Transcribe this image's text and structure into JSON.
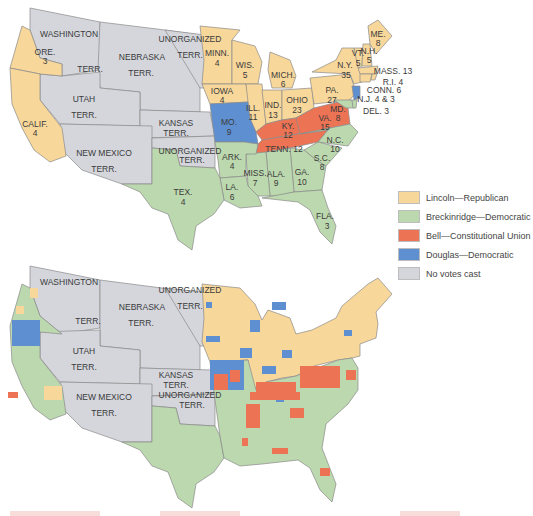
{
  "colors": {
    "lincoln": "#f8d79a",
    "breckinridge": "#bcd8ae",
    "bell": "#ec7455",
    "douglas": "#5e8fd0",
    "none": "#d4d6dc",
    "border": "#8a8a8a"
  },
  "legend": {
    "items": [
      {
        "label": "Lincoln—Republican",
        "color": "#f8d79a"
      },
      {
        "label": "Breckinridge—Democratic",
        "color": "#bcd8ae"
      },
      {
        "label": "Bell—Constitutional Union",
        "color": "#ec7455"
      },
      {
        "label": "Douglas—Democratic",
        "color": "#5e8fd0"
      },
      {
        "label": "No votes cast",
        "color": "#d4d6dc"
      }
    ]
  },
  "top_map": {
    "territories": {
      "washington": {
        "line1": "WASHINGTON",
        "line2": "TERR."
      },
      "nebraska": {
        "line1": "NEBRASKA",
        "line2": "TERR."
      },
      "unorganized_north": {
        "line1": "UNORGANIZED",
        "line2": "TERR."
      },
      "utah": {
        "line1": "UTAH",
        "line2": "TERR."
      },
      "kansas": {
        "line1": "KANSAS",
        "line2": "TERR."
      },
      "new_mexico": {
        "line1": "NEW MEXICO",
        "line2": "TERR."
      },
      "unorganized_south": {
        "line1": "UNORGANIZED",
        "line2": "TERR."
      }
    },
    "states": {
      "ore": {
        "name": "ORE.",
        "votes": "3"
      },
      "calif": {
        "name": "CALIF.",
        "votes": "4"
      },
      "minn": {
        "name": "MINN.",
        "votes": "4"
      },
      "wis": {
        "name": "WIS.",
        "votes": "5"
      },
      "iowa": {
        "name": "IOWA",
        "votes": "4"
      },
      "ill": {
        "name": "ILL.",
        "votes": "11"
      },
      "mich": {
        "name": "MICH.",
        "votes": "6"
      },
      "ind": {
        "name": "IND.",
        "votes": "13"
      },
      "ohio": {
        "name": "OHIO",
        "votes": "23"
      },
      "pa": {
        "name": "PA.",
        "votes": "27"
      },
      "ny": {
        "name": "N.Y.",
        "votes": "35"
      },
      "vt": {
        "name": "VT.",
        "votes": "5"
      },
      "nh": {
        "name": "N.H.",
        "votes": "5"
      },
      "me": {
        "name": "ME.",
        "votes": "8"
      },
      "mass": {
        "label": "MASS. 13"
      },
      "ri": {
        "label": "R.I. 4"
      },
      "conn": {
        "label": "CONN. 6"
      },
      "nj": {
        "label": "N.J. 4 & 3"
      },
      "del": {
        "label": "DEL. 3"
      },
      "md": {
        "name": "MD.",
        "votes": "8"
      },
      "mo": {
        "name": "MO.",
        "votes": "9"
      },
      "ky": {
        "name": "KY.",
        "votes": "12"
      },
      "va": {
        "name": "VA.",
        "votes": "15"
      },
      "tenn": {
        "label": "TENN. 12"
      },
      "nc": {
        "name": "N.C.",
        "votes": "10"
      },
      "sc": {
        "name": "S.C.",
        "votes": "8"
      },
      "ark": {
        "name": "ARK.",
        "votes": "4"
      },
      "miss": {
        "name": "MISS.",
        "votes": "7"
      },
      "ala": {
        "name": "ALA.",
        "votes": "9"
      },
      "ga": {
        "name": "GA.",
        "votes": "10"
      },
      "la": {
        "name": "LA.",
        "votes": "6"
      },
      "tex": {
        "name": "TEX.",
        "votes": "4"
      },
      "fla": {
        "name": "FLA.",
        "votes": "3"
      }
    }
  },
  "bottom_map": {
    "territories": {
      "washington": {
        "line1": "WASHINGTON",
        "line2": "TERR."
      },
      "nebraska": {
        "line1": "NEBRASKA",
        "line2": "TERR."
      },
      "unorganized_north": {
        "line1": "UNORGANIZED",
        "line2": "TERR."
      },
      "utah": {
        "line1": "UTAH",
        "line2": "TERR."
      },
      "kansas": {
        "line1": "KANSAS",
        "line2": "TERR."
      },
      "new_mexico": {
        "line1": "NEW MEXICO",
        "line2": "TERR."
      },
      "unorganized_south": {
        "line1": "UNORGANIZED",
        "line2": "TERR."
      }
    }
  }
}
